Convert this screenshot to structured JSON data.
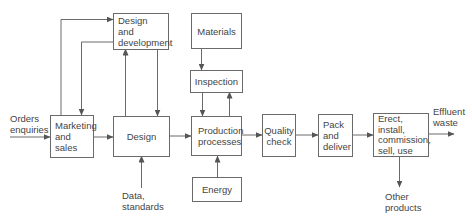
{
  "diagram": {
    "type": "flowchart",
    "colors": {
      "line": "#6a6a6a",
      "text": "#444444",
      "background": "#ffffff"
    },
    "boxes": {
      "design_development": {
        "lines": [
          "Design",
          "and",
          "development"
        ]
      },
      "materials": {
        "lines": [
          "Materials"
        ]
      },
      "inspection": {
        "lines": [
          "Inspection"
        ]
      },
      "marketing": {
        "lines": [
          "Marketing",
          "and",
          "sales"
        ]
      },
      "design": {
        "lines": [
          "Design"
        ]
      },
      "production": {
        "lines": [
          "Production",
          "processes"
        ]
      },
      "quality": {
        "lines": [
          "Quality",
          "check"
        ]
      },
      "pack": {
        "lines": [
          "Pack",
          "and",
          "deliver"
        ]
      },
      "erect": {
        "lines": [
          "Erect,",
          "install,",
          "commission,",
          "sell, use"
        ]
      },
      "energy": {
        "lines": [
          "Energy"
        ]
      }
    },
    "external_labels": {
      "orders": [
        "Orders",
        "enquiries"
      ],
      "data": [
        "Data,",
        "standards"
      ],
      "effluent": [
        "Effluent",
        "waste"
      ],
      "other": [
        "Other",
        "products"
      ]
    },
    "edges": [
      {
        "from": "Orders enquiries",
        "to": "Marketing and sales"
      },
      {
        "from": "Marketing and sales",
        "to": "Design and development"
      },
      {
        "from": "Design and development",
        "to": "Marketing and sales"
      },
      {
        "from": "Marketing and sales",
        "to": "Design"
      },
      {
        "from": "Design",
        "to": "Design and development"
      },
      {
        "from": "Design and development",
        "to": "Design"
      },
      {
        "from": "Data, standards",
        "to": "Design"
      },
      {
        "from": "Design",
        "to": "Production processes"
      },
      {
        "from": "Materials",
        "to": "Inspection"
      },
      {
        "from": "Inspection",
        "to": "Production processes"
      },
      {
        "from": "Production processes",
        "to": "Inspection"
      },
      {
        "from": "Energy",
        "to": "Production processes"
      },
      {
        "from": "Production processes",
        "to": "Quality check"
      },
      {
        "from": "Quality check",
        "to": "Pack and deliver"
      },
      {
        "from": "Pack and deliver",
        "to": "Erect, install, commission, sell, use"
      },
      {
        "from": "Erect, install, commission, sell, use",
        "to": "Effluent waste"
      },
      {
        "from": "Erect, install, commission, sell, use",
        "to": "Other products"
      }
    ]
  }
}
